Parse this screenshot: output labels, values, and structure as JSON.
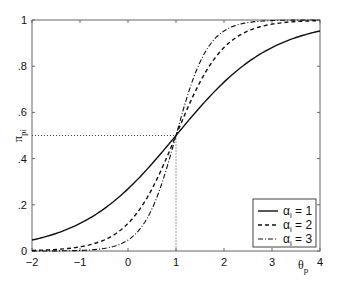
{
  "chart_data": {
    "type": "line",
    "title": "",
    "xlabel": "θ_p",
    "ylabel": "π_pi",
    "xlim": [
      -2,
      4
    ],
    "ylim": [
      0,
      1
    ],
    "grid": false,
    "legend_position": "lower right",
    "x_ticks": [
      -2,
      -1,
      0,
      1,
      2,
      3,
      4
    ],
    "x_tick_labels": [
      "−2",
      "−1",
      "0",
      "1",
      "2",
      "3",
      "4"
    ],
    "y_ticks": [
      0,
      0.2,
      0.4,
      0.6,
      0.8,
      1
    ],
    "y_tick_labels": [
      "0",
      ".2",
      ".4",
      ".6",
      ".8",
      "1"
    ],
    "x": [
      -2,
      -1.5,
      -1,
      -0.5,
      0,
      0.5,
      1,
      1.5,
      2,
      2.5,
      3,
      3.5,
      4
    ],
    "series": [
      {
        "name": "α_i = 1",
        "alpha": 1,
        "style": "solid",
        "values": [
          0.047,
          0.076,
          0.119,
          0.182,
          0.269,
          0.378,
          0.5,
          0.622,
          0.731,
          0.818,
          0.881,
          0.924,
          0.953
        ]
      },
      {
        "name": "α_i = 2",
        "alpha": 2,
        "style": "dashed",
        "values": [
          0.002,
          0.007,
          0.018,
          0.047,
          0.119,
          0.269,
          0.5,
          0.731,
          0.881,
          0.953,
          0.982,
          0.993,
          0.998
        ]
      },
      {
        "name": "α_i = 3",
        "alpha": 3,
        "style": "dash-dot",
        "values": [
          0.0,
          0.001,
          0.002,
          0.011,
          0.047,
          0.182,
          0.5,
          0.818,
          0.953,
          0.989,
          0.998,
          1.0,
          1.0
        ]
      }
    ],
    "annotations": [
      {
        "type": "dotted-guide",
        "from": [
          -2,
          0.5
        ],
        "to": [
          1,
          0.5
        ]
      },
      {
        "type": "dotted-guide",
        "from": [
          1,
          0.5
        ],
        "to": [
          1,
          0
        ]
      }
    ]
  },
  "legend": {
    "items": [
      {
        "prefix": "α",
        "sub": "i",
        "suffix": " = 1",
        "style": "solid"
      },
      {
        "prefix": "α",
        "sub": "i",
        "suffix": " = 2",
        "style": "dashed"
      },
      {
        "prefix": "α",
        "sub": "i",
        "suffix": " = 3",
        "style": "dash-dot"
      }
    ]
  },
  "axes": {
    "xlabel_main": "θ",
    "xlabel_sub": "p",
    "ylabel_main": "π",
    "ylabel_sub": "pi"
  },
  "colors": {
    "line": "#111111",
    "axis": "#555555",
    "guide": "#444444"
  }
}
